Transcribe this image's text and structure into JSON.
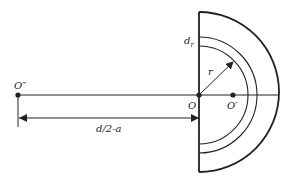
{
  "diagram": {
    "labels": {
      "o_double_prime": "O″",
      "o": "O",
      "o_prime": "O′",
      "r": "r",
      "d_r_base": "d",
      "d_r_sub": "r",
      "distance": "d/2-a"
    },
    "colors": {
      "stroke": "#222222",
      "background": "#ffffff"
    }
  }
}
